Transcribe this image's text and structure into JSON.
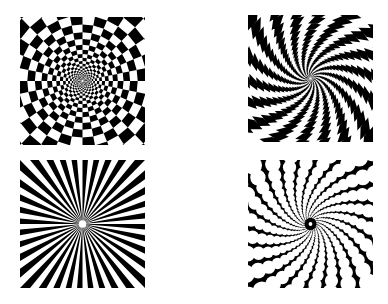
{
  "colors": {
    "foreground": "#000000",
    "background": "#ffffff"
  },
  "panels": [
    {
      "id": "p-tl",
      "name": "radial-checkerboard-pattern",
      "type": "checker",
      "rings": 22,
      "sectors": 32,
      "twist": 0.0,
      "growth": 1.16
    },
    {
      "id": "p-tr",
      "name": "spiral-checkerboard-pattern",
      "type": "checker",
      "rings": 26,
      "sectors": 36,
      "twist": 0.12,
      "growth": 1.13
    },
    {
      "id": "p-bl",
      "name": "radial-starburst-pattern",
      "type": "rays",
      "rays": 36
    },
    {
      "id": "p-br",
      "name": "radial-dot-pattern",
      "type": "dots",
      "rings": 18,
      "sectors": 22,
      "twist": 0.07,
      "growth": 1.17
    }
  ]
}
